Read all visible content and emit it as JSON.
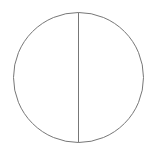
{
  "diagram": {
    "shape": "circle-with-vertical-diameter",
    "background": "#ffffff",
    "stroke_color": "#777777",
    "circle": {
      "cx": 78.5,
      "cy": 77.5,
      "r": 65
    },
    "diameter_line": {
      "x1": 78.5,
      "y1": 12.5,
      "x2": 78.5,
      "y2": 142.5
    }
  }
}
